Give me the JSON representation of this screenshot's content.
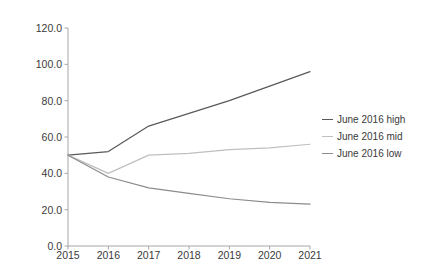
{
  "chart_data": {
    "type": "line",
    "title": "",
    "subtitle": "",
    "xlabel": "",
    "ylabel": "",
    "categories": [
      "2015",
      "2016",
      "2017",
      "2018",
      "2019",
      "2020",
      "2021"
    ],
    "x": [
      2015,
      2016,
      2017,
      2018,
      2019,
      2020,
      2021
    ],
    "ylim": [
      0.0,
      120.0
    ],
    "ytick_labels": [
      "0.0",
      "20.0",
      "40.0",
      "60.0",
      "80.0",
      "100.0",
      "120.0"
    ],
    "ytick_values": [
      0.0,
      20.0,
      40.0,
      60.0,
      80.0,
      100.0,
      120.0
    ],
    "grid": false,
    "legend_position": "right",
    "series": [
      {
        "name": "June 2016 high",
        "color": "#595959",
        "values": [
          50,
          52,
          66,
          73,
          80,
          88,
          96
        ]
      },
      {
        "name": "June 2016 mid",
        "color": "#bfbfbf",
        "values": [
          50,
          40,
          50,
          51,
          53,
          54,
          56
        ]
      },
      {
        "name": "June 2016 low",
        "color": "#8c8c8c",
        "values": [
          50,
          38,
          32,
          29,
          26,
          24,
          23
        ]
      }
    ]
  },
  "legend": {
    "items": [
      {
        "label": "June 2016 high"
      },
      {
        "label": "June 2016 mid"
      },
      {
        "label": "June 2016 low"
      }
    ]
  },
  "axis": {
    "axis_color": "#a6a6a6"
  }
}
